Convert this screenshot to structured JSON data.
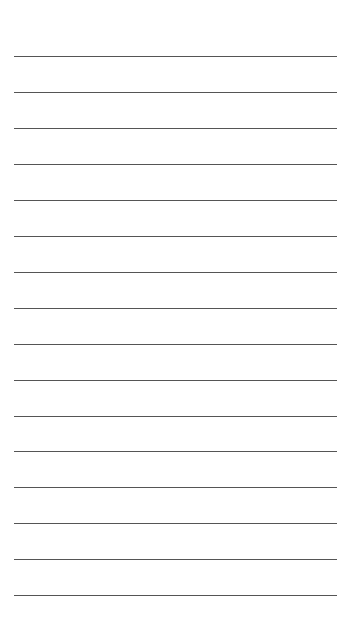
{
  "document": {
    "type": "lined-paper",
    "title": "Blank ruled note page",
    "page_width": 356,
    "page_height": 624,
    "background_color": "#ffffff",
    "text_content": "",
    "has_text": false
  },
  "ruling": {
    "line_count": 16,
    "line_color": "#555555",
    "line_thickness": 1,
    "left_margin": 14,
    "right_margin": 19,
    "line_length": 323,
    "first_line_y": 56,
    "last_line_y": 595,
    "line_spacing": 35.9,
    "lines": [
      {
        "index": 1,
        "y": 56,
        "x1": 14,
        "x2": 337,
        "content": ""
      },
      {
        "index": 2,
        "y": 92,
        "x1": 14,
        "x2": 337,
        "content": ""
      },
      {
        "index": 3,
        "y": 128,
        "x1": 14,
        "x2": 337,
        "content": ""
      },
      {
        "index": 4,
        "y": 164,
        "x1": 14,
        "x2": 337,
        "content": ""
      },
      {
        "index": 5,
        "y": 200,
        "x1": 14,
        "x2": 337,
        "content": ""
      },
      {
        "index": 6,
        "y": 236,
        "x1": 14,
        "x2": 337,
        "content": ""
      },
      {
        "index": 7,
        "y": 272,
        "x1": 14,
        "x2": 337,
        "content": ""
      },
      {
        "index": 8,
        "y": 308,
        "x1": 14,
        "x2": 337,
        "content": ""
      },
      {
        "index": 9,
        "y": 344,
        "x1": 14,
        "x2": 337,
        "content": ""
      },
      {
        "index": 10,
        "y": 380,
        "x1": 14,
        "x2": 337,
        "content": ""
      },
      {
        "index": 11,
        "y": 416,
        "x1": 14,
        "x2": 337,
        "content": ""
      },
      {
        "index": 12,
        "y": 451,
        "x1": 14,
        "x2": 337,
        "content": ""
      },
      {
        "index": 13,
        "y": 487,
        "x1": 14,
        "x2": 337,
        "content": ""
      },
      {
        "index": 14,
        "y": 523,
        "x1": 14,
        "x2": 337,
        "content": ""
      },
      {
        "index": 15,
        "y": 559,
        "x1": 14,
        "x2": 337,
        "content": ""
      },
      {
        "index": 16,
        "y": 595,
        "x1": 14,
        "x2": 337,
        "content": ""
      }
    ]
  }
}
